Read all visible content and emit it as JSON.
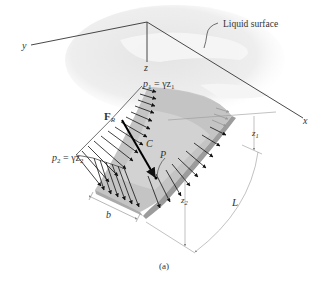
{
  "figure": {
    "caption": "(a)",
    "callout": "Liquid surface",
    "axes": {
      "x": "x",
      "y": "y",
      "z": "z"
    },
    "pressure_top": {
      "symbol": "p",
      "sub": "1",
      "eq": " = γz",
      "eq_sub": "1"
    },
    "pressure_bottom": {
      "symbol": "p",
      "sub": "2",
      "eq": " = γz",
      "eq_sub": "2"
    },
    "resultant_force": {
      "symbol": "F",
      "sub": "R"
    },
    "centroid_label": "C",
    "center_pressure_label": "P",
    "dims": {
      "width": "b",
      "length": "L",
      "depth_top": {
        "symbol": "z",
        "sub": "1"
      },
      "depth_bottom": {
        "symbol": "z",
        "sub": "2"
      }
    },
    "colors": {
      "line": "#333333",
      "liquid": "#e6e6e6",
      "plate_face": "#bdbdbd",
      "plate_edge": "#9a9a9a",
      "dim_line": "#9a9a9a"
    }
  }
}
